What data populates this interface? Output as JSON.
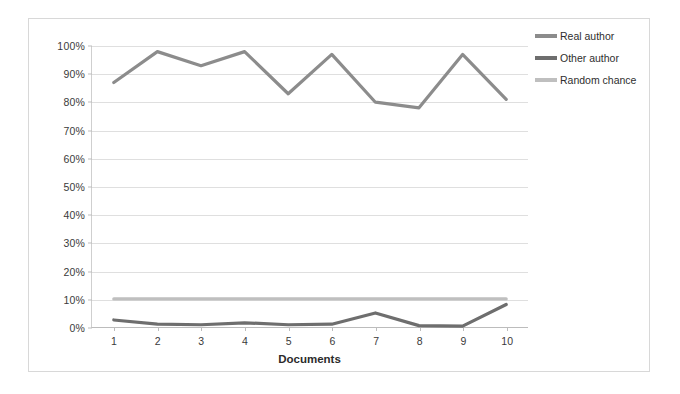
{
  "chart_data": {
    "type": "line",
    "title": "",
    "xlabel": "Documents",
    "ylabel": "",
    "categories": [
      "1",
      "2",
      "3",
      "4",
      "5",
      "6",
      "7",
      "8",
      "9",
      "10"
    ],
    "x": [
      1,
      2,
      3,
      4,
      5,
      6,
      7,
      8,
      9,
      10
    ],
    "ylim": [
      0,
      100
    ],
    "ytick_labels": [
      "0%",
      "10%",
      "20%",
      "30%",
      "40%",
      "50%",
      "60%",
      "70%",
      "80%",
      "90%",
      "100%"
    ],
    "ytick_values": [
      0,
      10,
      20,
      30,
      40,
      50,
      60,
      70,
      80,
      90,
      100
    ],
    "grid": true,
    "legend_position": "top-right",
    "series": [
      {
        "name": "Real author",
        "color": "#8c8c8c",
        "values": [
          87,
          98,
          93,
          98,
          83,
          97,
          80,
          78,
          97,
          81
        ]
      },
      {
        "name": "Other author",
        "color": "#6e6e6e",
        "values": [
          2.5,
          1,
          0.8,
          1.5,
          0.8,
          1,
          5,
          0.5,
          0.3,
          8
        ]
      },
      {
        "name": "Random chance",
        "color": "#bfbfbf",
        "values": [
          10,
          10,
          10,
          10,
          10,
          10,
          10,
          10,
          10,
          10
        ]
      }
    ]
  },
  "legend": {
    "items": [
      {
        "label": "Real author",
        "color": "#8c8c8c"
      },
      {
        "label": "Other author",
        "color": "#6e6e6e"
      },
      {
        "label": "Random chance",
        "color": "#bfbfbf"
      }
    ]
  },
  "axis": {
    "x_title": "Documents"
  }
}
